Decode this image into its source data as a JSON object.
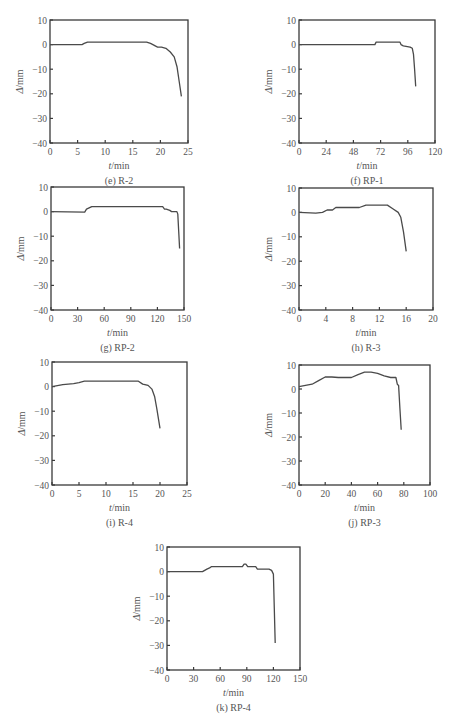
{
  "chart_data": [
    {
      "id": "e",
      "type": "line",
      "caption": "(e) R-2",
      "xlabel": "t/min",
      "ylabel": "Δ/mm",
      "xlim": [
        0,
        25
      ],
      "ylim": [
        -40,
        10
      ],
      "xticks": [
        0,
        5,
        10,
        15,
        20,
        25
      ],
      "yticks": [
        10,
        0,
        -10,
        -20,
        -30,
        -40
      ],
      "grid": false,
      "series": [
        {
          "name": "R-2",
          "x": [
            0,
            5.8,
            6.2,
            6.8,
            10,
            15,
            17.5,
            18.2,
            19.5,
            20.2,
            21,
            21.8,
            22.5,
            23,
            23.4,
            23.8
          ],
          "y": [
            0,
            0,
            0.5,
            1,
            1,
            1,
            1,
            0.5,
            -1,
            -1,
            -1.5,
            -3,
            -5,
            -9,
            -15,
            -21
          ]
        }
      ]
    },
    {
      "id": "f",
      "type": "line",
      "caption": "(f) RP-1",
      "xlabel": "t/min",
      "ylabel": "Δ/mm",
      "xlim": [
        0,
        120
      ],
      "ylim": [
        -40,
        10
      ],
      "xticks": [
        0,
        24,
        48,
        72,
        96,
        120
      ],
      "yticks": [
        10,
        0,
        -10,
        -20,
        -30,
        -40
      ],
      "grid": false,
      "series": [
        {
          "name": "RP-1",
          "x": [
            0,
            67,
            68,
            70,
            85,
            89,
            90,
            92,
            98,
            100,
            101,
            102,
            103
          ],
          "y": [
            0,
            0,
            1,
            1,
            1,
            1,
            0,
            -0.5,
            -1,
            -1.5,
            -4,
            -10,
            -17
          ]
        }
      ]
    },
    {
      "id": "g",
      "type": "line",
      "caption": "(g) RP-2",
      "xlabel": "t/min",
      "ylabel": "Δ/mm",
      "xlim": [
        0,
        150
      ],
      "ylim": [
        -40,
        10
      ],
      "xticks": [
        0,
        30,
        60,
        90,
        120,
        150
      ],
      "yticks": [
        10,
        0,
        -10,
        -20,
        -30,
        -40
      ],
      "grid": false,
      "series": [
        {
          "name": "RP-2",
          "x": [
            0,
            38,
            40,
            43,
            46,
            90,
            126,
            128,
            130,
            134,
            136,
            142,
            143,
            144,
            145
          ],
          "y": [
            0,
            -0.2,
            1,
            1.5,
            2,
            2,
            2,
            1,
            1,
            0.5,
            0,
            0,
            -1,
            -8,
            -15
          ]
        }
      ]
    },
    {
      "id": "h",
      "type": "line",
      "caption": "(h) R-3",
      "xlabel": "t/min",
      "ylabel": "Δ/mm",
      "xlim": [
        0,
        20
      ],
      "ylim": [
        -40,
        10
      ],
      "xticks": [
        0,
        4,
        8,
        12,
        16,
        20
      ],
      "yticks": [
        10,
        0,
        -10,
        -20,
        -30,
        -40
      ],
      "grid": false,
      "series": [
        {
          "name": "R-3",
          "x": [
            0,
            2.5,
            3.5,
            4.2,
            5,
            5.5,
            6.5,
            8,
            9,
            10,
            12,
            13.2,
            14,
            14.8,
            15.2,
            15.6,
            16
          ],
          "y": [
            0,
            -0.3,
            0,
            1,
            1,
            2,
            2,
            2,
            2,
            3,
            3,
            3,
            1.5,
            0,
            -2,
            -8,
            -16
          ]
        }
      ]
    },
    {
      "id": "i",
      "type": "line",
      "caption": "(i) R-4",
      "xlabel": "t/min",
      "ylabel": "Δ/mm",
      "xlim": [
        0,
        25
      ],
      "ylim": [
        -40,
        10
      ],
      "xticks": [
        0,
        5,
        10,
        15,
        20,
        25
      ],
      "yticks": [
        10,
        0,
        -10,
        -20,
        -30,
        -40
      ],
      "grid": false,
      "series": [
        {
          "name": "R-4",
          "x": [
            0,
            2,
            4,
            5,
            6,
            8,
            12,
            16,
            16.8,
            17.8,
            18.5,
            19,
            19.4,
            20
          ],
          "y": [
            0,
            0.8,
            1.2,
            1.6,
            2.2,
            2.2,
            2.2,
            2.2,
            1,
            0.5,
            -1,
            -4,
            -9,
            -17
          ]
        }
      ]
    },
    {
      "id": "j",
      "type": "line",
      "caption": "(j) RP-3",
      "xlabel": "t/min",
      "ylabel": "Δ/mm",
      "xlim": [
        0,
        100
      ],
      "ylim": [
        -40,
        10
      ],
      "xticks": [
        0,
        20,
        40,
        60,
        80,
        100
      ],
      "yticks": [
        10,
        0,
        -10,
        -20,
        -30,
        -40
      ],
      "grid": false,
      "series": [
        {
          "name": "RP-3",
          "x": [
            0,
            5,
            10,
            15,
            20,
            25,
            30,
            40,
            45,
            50,
            55,
            60,
            65,
            70,
            74,
            75,
            76,
            77,
            78
          ],
          "y": [
            1,
            1.5,
            2,
            3.5,
            5,
            5,
            4.8,
            4.8,
            6,
            7,
            7,
            6.5,
            5.5,
            4.8,
            4.8,
            2,
            1.5,
            -8,
            -17
          ]
        }
      ]
    },
    {
      "id": "k",
      "type": "line",
      "caption": "(k) RP-4",
      "xlabel": "t/min",
      "ylabel": "Δ/mm",
      "xlim": [
        0,
        150
      ],
      "ylim": [
        -40,
        10
      ],
      "xticks": [
        0,
        30,
        60,
        90,
        120,
        150
      ],
      "yticks": [
        10,
        0,
        -10,
        -20,
        -30,
        -40
      ],
      "grid": false,
      "series": [
        {
          "name": "RP-4",
          "x": [
            0,
            40,
            45,
            48,
            50,
            60,
            85,
            87,
            89,
            91,
            92,
            100,
            102,
            104,
            115,
            118,
            120,
            121,
            122
          ],
          "y": [
            0,
            0,
            1,
            1.5,
            2,
            2,
            2,
            3,
            3,
            2,
            2,
            2,
            1,
            1,
            1,
            0.5,
            -1,
            -15,
            -29
          ]
        }
      ]
    }
  ],
  "layout": [
    {
      "id": "e",
      "left": 10,
      "top": 0,
      "plotX": 40,
      "plotY": 20,
      "plotW": 138,
      "plotH": 123
    },
    {
      "id": "f",
      "left": 259,
      "top": 0,
      "plotX": 40,
      "plotY": 20,
      "plotW": 136,
      "plotH": 123
    },
    {
      "id": "g",
      "left": 10,
      "top": 167,
      "plotX": 41,
      "plotY": 20,
      "plotW": 133,
      "plotH": 123
    },
    {
      "id": "h",
      "left": 259,
      "top": 168,
      "plotX": 40,
      "plotY": 20,
      "plotW": 134,
      "plotH": 122
    },
    {
      "id": "i",
      "left": 10,
      "top": 342,
      "plotX": 42,
      "plotY": 20,
      "plotW": 135,
      "plotH": 123
    },
    {
      "id": "j",
      "left": 259,
      "top": 345,
      "plotX": 40,
      "plotY": 20,
      "plotW": 131,
      "plotH": 120
    },
    {
      "id": "k",
      "left": 127,
      "top": 527,
      "plotX": 40,
      "plotY": 20,
      "plotW": 133,
      "plotH": 123
    }
  ],
  "colors": {
    "line": "#4a4a4a",
    "frame": "#3a3a3a",
    "text": "#555555"
  }
}
